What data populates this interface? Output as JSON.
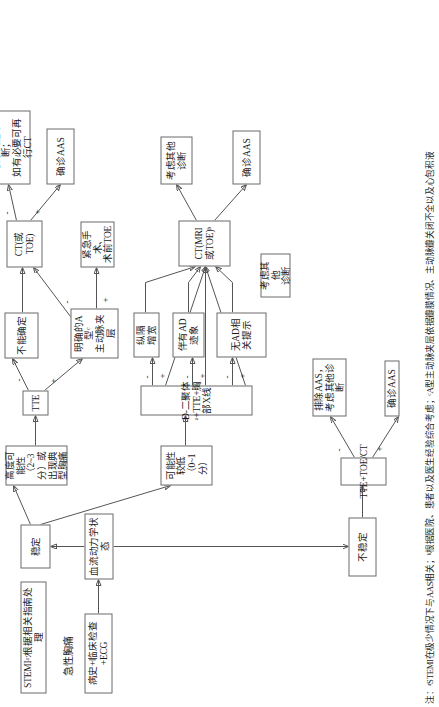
{
  "figure": {
    "title": "急性胸痛",
    "footnote": "注：ᵃSTEMI在极少情况下与AAS相关；ᵇ根据医院、患者以及医生经验综合考虑；ᶜA型主动脉夹层依据瓣膜情况、主动脉瓣关闭不全以及心包积液"
  },
  "nodes": {
    "intake": "病史+临床检查+ECG",
    "stemi": "STEMIᵃ:根据相关指南处理",
    "hemodynamics": "血流动力学状态",
    "stable": "稳定",
    "unstable": "不稳定",
    "low_prob": "可能性较低（0~1分）",
    "high_prob": "高度可能性（2~3分）或\n出现典型胸痛",
    "tte": "TTE",
    "tte_toe_ct": "TTE+TOE/CT",
    "unstable_neg": "排除AAS，\n考虑其他诊断",
    "unstable_pos": "确诊AAS",
    "indeterminate": "不能确定",
    "type_a": "明确的A型ᶜ\n主动脉夹层",
    "surgery": "紧急手术、\n术前TOE",
    "ct_toe": "CT(或TOE)",
    "ct_toe_neg": "考虑其他诊断；\n如有必要可再行CT",
    "ct_toe_pos": "确诊AAS",
    "dimer": "D-二聚体ᵃ+TTE+胸部X线",
    "mediastinum": "纵隔\n增宽",
    "ad_signs": "伴有AD\n迹象",
    "no_ad": "无AD相关提示",
    "other_dx_low": "考虑其他\n诊断",
    "ct_mri_toe": "CT(MRI或TOE)ᵇ",
    "ct_mri_neg": "考虑其他\n诊断",
    "ct_mri_pos": "确诊AAS"
  },
  "edge_labels": {
    "minus": "-",
    "plus": "+"
  },
  "colors": {
    "box_border": "#6b6b6b",
    "connector": "#555555",
    "text": "#1a1a1a",
    "background": "#ffffff"
  }
}
